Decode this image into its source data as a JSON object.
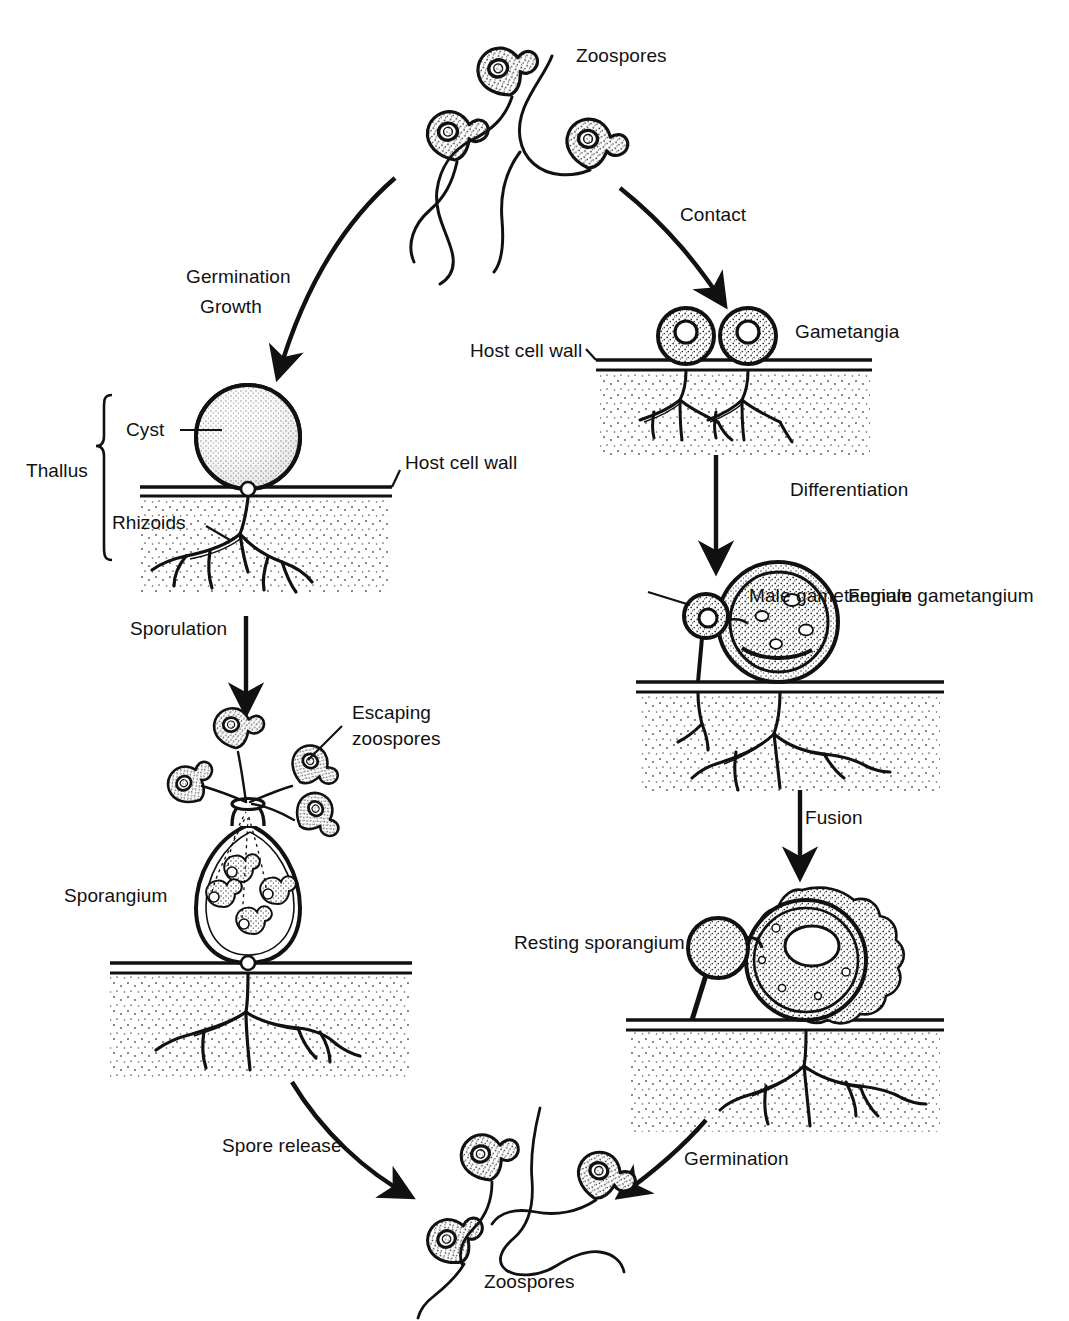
{
  "diagram": {
    "type": "biological-life-cycle",
    "background_color": "#ffffff",
    "ink_color": "#111111",
    "stipple_color": "#2a2a2a"
  },
  "labels": {
    "zoospores_top": "Zoospores",
    "zoospores_bottom": "Zoospores",
    "gametangia": "Gametangia",
    "host_cell_wall_right": "Host cell wall",
    "host_cell_wall_left": "Host cell wall",
    "thallus": "Thallus",
    "cyst": "Cyst",
    "rhizoids": "Rhizoids",
    "male_gametangium": "Male gametangium",
    "female_gametangium": "Female gametangium",
    "escaping_zoospores_line1": "Escaping",
    "escaping_zoospores_line2": "zoospores",
    "sporangium": "Sporangium",
    "resting_sporangium": "Resting sporangium"
  },
  "arrows": [
    {
      "id": "germination-growth",
      "label_line1": "Germination",
      "label_line2": "Growth",
      "from": "zoospores-top",
      "to": "cyst-thallus",
      "style": "curved"
    },
    {
      "id": "contact",
      "label": "Contact",
      "from": "zoospores-top",
      "to": "gametangia",
      "style": "curved"
    },
    {
      "id": "sporulation",
      "label": "Sporulation",
      "from": "cyst-thallus",
      "to": "sporangium",
      "style": "straight"
    },
    {
      "id": "differentiation",
      "label": "Differentiation",
      "from": "gametangia",
      "to": "gametangium-pair",
      "style": "straight"
    },
    {
      "id": "fusion",
      "label": "Fusion",
      "from": "gametangium-pair",
      "to": "resting-sporangium",
      "style": "straight"
    },
    {
      "id": "spore-release",
      "label": "Spore release",
      "from": "sporangium",
      "to": "zoospores-bottom",
      "style": "curved"
    },
    {
      "id": "germination-bottom",
      "label": "Germination",
      "from": "resting-sporangium",
      "to": "zoospores-bottom",
      "style": "curved"
    }
  ],
  "stages": [
    {
      "id": "zoospores-top",
      "name": "Zoospores",
      "count": 3,
      "has_flagella": true
    },
    {
      "id": "cyst-thallus",
      "name": "Thallus",
      "parts": [
        "Cyst",
        "Rhizoids"
      ],
      "on_host_wall": true
    },
    {
      "id": "sporangium",
      "name": "Sporangium",
      "internal_zoospores": 4,
      "escaping_zoospores": 4
    },
    {
      "id": "gametangia",
      "name": "Gametangia",
      "count": 2,
      "on_host_wall": true
    },
    {
      "id": "gametangium-pair",
      "name": "Gametangia differentiated",
      "parts": [
        "Male gametangium",
        "Female gametangium"
      ]
    },
    {
      "id": "resting-sporangium",
      "name": "Resting sporangium",
      "wall": "thick-warty"
    },
    {
      "id": "zoospores-bottom",
      "name": "Zoospores",
      "count": 3,
      "has_flagella": true
    }
  ]
}
